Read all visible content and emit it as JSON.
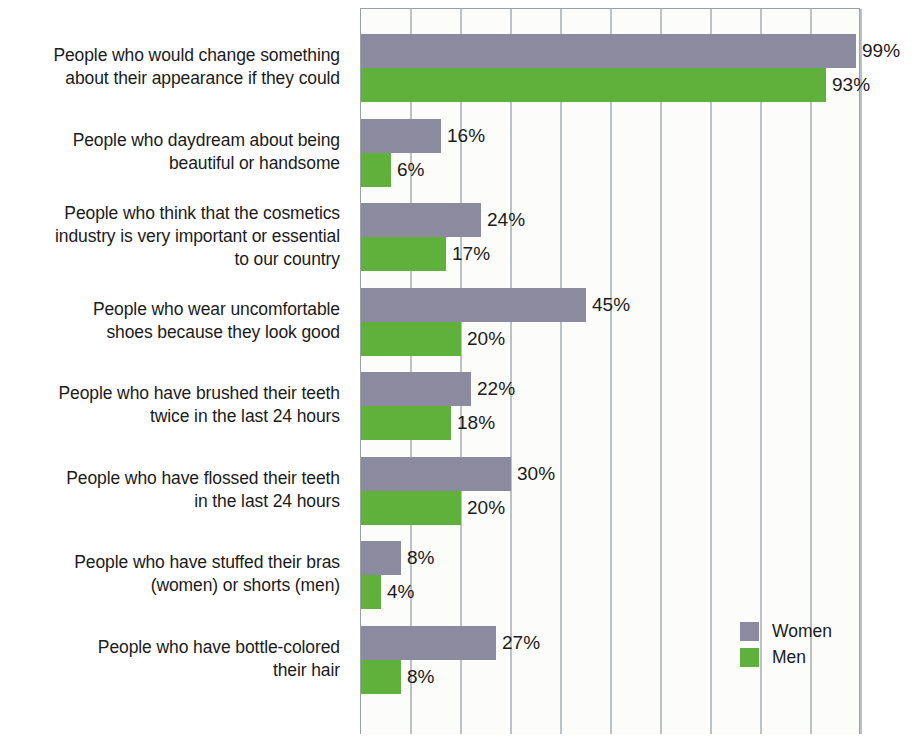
{
  "chart_data": {
    "type": "bar",
    "orientation": "horizontal",
    "title": "",
    "subtitle": "",
    "xlabel": "",
    "ylabel": "",
    "xlim": [
      0,
      100
    ],
    "grid": true,
    "gridline_interval": 10,
    "gridline_count": 10,
    "legend_position": "bottom-right",
    "value_suffix": "%",
    "categories": [
      "People who would change something about their appearance if they could",
      "People who daydream about being beautiful or handsome",
      "People who think that the cosmetics industry is very important or essential to our country",
      "People who wear uncomfortable shoes because they look good",
      "People who have brushed their teeth twice in the last 24 hours",
      "People who have flossed their teeth in the last 24 hours",
      "People who have stuffed their bras (women) or shorts (men)",
      "People who have bottle-colored their hair"
    ],
    "series": [
      {
        "name": "Women",
        "color": "#8b8a9e",
        "values": [
          99,
          16,
          24,
          45,
          22,
          30,
          8,
          27
        ],
        "labels": [
          "99%",
          "16%",
          "24%",
          "45%",
          "22%",
          "30%",
          "8%",
          "27%"
        ]
      },
      {
        "name": "Men",
        "color": "#5fb13c",
        "values": [
          93,
          6,
          17,
          20,
          18,
          20,
          4,
          8
        ],
        "labels": [
          "93%",
          "6%",
          "17%",
          "20%",
          "18%",
          "20%",
          "4%",
          "8%"
        ]
      }
    ]
  },
  "category_lines": [
    [
      "People who would change something",
      "about their appearance if they could"
    ],
    [
      "People who daydream about being",
      "beautiful or handsome"
    ],
    [
      "People who think that the cosmetics",
      "industry is very important or essential",
      "to our country"
    ],
    [
      "People who wear uncomfortable",
      "shoes because they look good"
    ],
    [
      "People who have brushed their teeth",
      "twice in the last 24 hours"
    ],
    [
      "People who have flossed their teeth",
      "in the last 24 hours"
    ],
    [
      "People who have stuffed their bras",
      "(women) or shorts (men)"
    ],
    [
      "People who have bottle-colored",
      "their hair"
    ]
  ],
  "legend": {
    "items": [
      {
        "label": "Women",
        "color": "#8b8a9e"
      },
      {
        "label": "Men",
        "color": "#5fb13c"
      }
    ]
  },
  "colors": {
    "women": "#8b8a9e",
    "men": "#5fb13c",
    "gridline": "#bcc1c4",
    "axis": "#9aa0a4",
    "plot_background": "#fcfcfb",
    "text": "#1b1b1b"
  }
}
